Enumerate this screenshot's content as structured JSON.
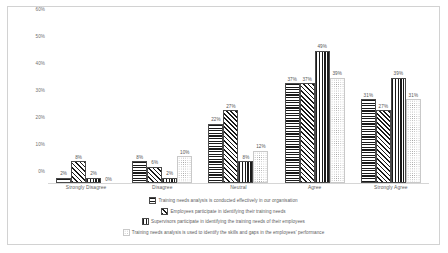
{
  "chart_data": {
    "type": "bar",
    "title": "",
    "xlabel": "",
    "ylabel": "",
    "ylim": [
      0,
      60
    ],
    "ytick_labels": [
      "60%",
      "50%",
      "40%",
      "30%",
      "20%",
      "10%",
      "0%"
    ],
    "ytick_values": [
      60,
      50,
      40,
      30,
      20,
      10,
      0
    ],
    "grid": false,
    "legend_position": "bottom",
    "categories": [
      "Strongly Disagree",
      "Disagree",
      "Neutral",
      "Agree",
      "Strongly Agree"
    ],
    "series": [
      {
        "name": "Training needs analysis is conducted effectively in our organisation",
        "pattern": "horizontal-lines",
        "values": [
          2,
          8,
          22,
          37,
          31
        ],
        "labels": [
          "2%",
          "8%",
          "22%",
          "37%",
          "31%"
        ]
      },
      {
        "name": "Employees participate in identifying their training needs",
        "pattern": "diagonal-lines",
        "values": [
          8,
          6,
          27,
          37,
          27
        ],
        "labels": [
          "8%",
          "6%",
          "27%",
          "37%",
          "27%"
        ]
      },
      {
        "name": "Supervisors participate in identifying the training needs of their employees",
        "pattern": "vertical-lines",
        "values": [
          2,
          2,
          8,
          49,
          39
        ],
        "labels": [
          "2%",
          "2%",
          "8%",
          "49%",
          "39%"
        ]
      },
      {
        "name": "Training needs analysis is used to identify the skills and gaps in the employees' performance",
        "pattern": "dots",
        "values": [
          0,
          10,
          12,
          39,
          31
        ],
        "labels": [
          "0%",
          "10%",
          "12%",
          "39%",
          "31%"
        ]
      }
    ]
  },
  "legend": {
    "items": [
      {
        "label": "Training needs analysis is conducted effectively in our organisation",
        "pattern": "horizontal-lines"
      },
      {
        "label": "Employees participate in identifying their training needs",
        "pattern": "diagonal-lines"
      },
      {
        "label": "Supervisors participate in identifying the training needs of their employees",
        "pattern": "vertical-lines"
      },
      {
        "label": "Training needs analysis is used to identify the skills and gaps in the employees' performance",
        "pattern": "dots"
      }
    ]
  },
  "colors": {
    "bar_stroke": "#4a4a4a",
    "bar_fill": "#1a1a1a",
    "axis": "#d6d6d6",
    "text": "#5d5d5d",
    "frame": "#d2d2d2",
    "background": "#ffffff"
  }
}
